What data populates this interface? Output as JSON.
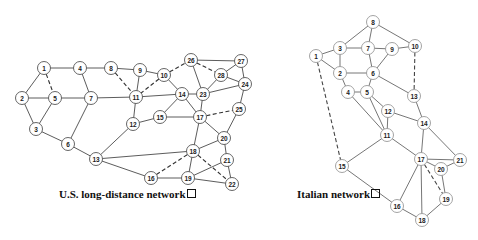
{
  "figure": {
    "networks": [
      {
        "id": "us",
        "caption": "U.S. long-distance network",
        "caption_pos": [
          59,
          188
        ],
        "nodes": [
          {
            "id": "1",
            "x": 44,
            "y": 68
          },
          {
            "id": "2",
            "x": 22,
            "y": 98
          },
          {
            "id": "3",
            "x": 36,
            "y": 129
          },
          {
            "id": "4",
            "x": 80,
            "y": 68
          },
          {
            "id": "5",
            "x": 55,
            "y": 98
          },
          {
            "id": "6",
            "x": 68,
            "y": 144
          },
          {
            "id": "7",
            "x": 91,
            "y": 98
          },
          {
            "id": "8",
            "x": 111,
            "y": 68
          },
          {
            "id": "9",
            "x": 140,
            "y": 70
          },
          {
            "id": "10",
            "x": 164,
            "y": 75
          },
          {
            "id": "11",
            "x": 136,
            "y": 97
          },
          {
            "id": "12",
            "x": 133,
            "y": 124
          },
          {
            "id": "13",
            "x": 96,
            "y": 159
          },
          {
            "id": "14",
            "x": 182,
            "y": 94
          },
          {
            "id": "15",
            "x": 160,
            "y": 117
          },
          {
            "id": "16",
            "x": 151,
            "y": 178
          },
          {
            "id": "17",
            "x": 200,
            "y": 117
          },
          {
            "id": "18",
            "x": 193,
            "y": 151
          },
          {
            "id": "19",
            "x": 188,
            "y": 178
          },
          {
            "id": "20",
            "x": 224,
            "y": 138
          },
          {
            "id": "21",
            "x": 227,
            "y": 160
          },
          {
            "id": "22",
            "x": 232,
            "y": 184
          },
          {
            "id": "23",
            "x": 203,
            "y": 94
          },
          {
            "id": "24",
            "x": 245,
            "y": 84
          },
          {
            "id": "25",
            "x": 239,
            "y": 109
          },
          {
            "id": "26",
            "x": 191,
            "y": 60
          },
          {
            "id": "27",
            "x": 241,
            "y": 61
          },
          {
            "id": "28",
            "x": 221,
            "y": 75
          }
        ],
        "edges": [
          [
            "1",
            "4",
            "solid"
          ],
          [
            "1",
            "2",
            "solid"
          ],
          [
            "1",
            "5",
            "dashed"
          ],
          [
            "2",
            "5",
            "solid"
          ],
          [
            "2",
            "3",
            "solid"
          ],
          [
            "3",
            "5",
            "solid"
          ],
          [
            "3",
            "6",
            "solid"
          ],
          [
            "4",
            "7",
            "solid"
          ],
          [
            "4",
            "8",
            "solid"
          ],
          [
            "5",
            "7",
            "solid"
          ],
          [
            "6",
            "7",
            "solid"
          ],
          [
            "6",
            "13",
            "solid"
          ],
          [
            "7",
            "11",
            "solid"
          ],
          [
            "8",
            "9",
            "solid"
          ],
          [
            "8",
            "11",
            "dashed"
          ],
          [
            "9",
            "11",
            "solid"
          ],
          [
            "9",
            "10",
            "solid"
          ],
          [
            "10",
            "11",
            "dashed"
          ],
          [
            "10",
            "26",
            "dashed"
          ],
          [
            "10",
            "14",
            "solid"
          ],
          [
            "11",
            "14",
            "solid"
          ],
          [
            "11",
            "12",
            "solid"
          ],
          [
            "12",
            "15",
            "solid"
          ],
          [
            "12",
            "13",
            "solid"
          ],
          [
            "13",
            "18",
            "solid"
          ],
          [
            "13",
            "16",
            "solid"
          ],
          [
            "14",
            "15",
            "solid"
          ],
          [
            "14",
            "17",
            "solid"
          ],
          [
            "14",
            "23",
            "solid"
          ],
          [
            "15",
            "17",
            "solid"
          ],
          [
            "16",
            "18",
            "dashed"
          ],
          [
            "16",
            "19",
            "solid"
          ],
          [
            "17",
            "18",
            "solid"
          ],
          [
            "17",
            "20",
            "solid"
          ],
          [
            "17",
            "25",
            "dashed"
          ],
          [
            "17",
            "23",
            "solid"
          ],
          [
            "18",
            "20",
            "solid"
          ],
          [
            "18",
            "19",
            "solid"
          ],
          [
            "18",
            "22",
            "dashed"
          ],
          [
            "19",
            "22",
            "solid"
          ],
          [
            "19",
            "21",
            "solid"
          ],
          [
            "20",
            "21",
            "solid"
          ],
          [
            "20",
            "25",
            "solid"
          ],
          [
            "21",
            "22",
            "solid"
          ],
          [
            "23",
            "26",
            "solid"
          ],
          [
            "23",
            "28",
            "solid"
          ],
          [
            "23",
            "24",
            "solid"
          ],
          [
            "24",
            "25",
            "solid"
          ],
          [
            "24",
            "27",
            "solid"
          ],
          [
            "24",
            "28",
            "solid"
          ],
          [
            "26",
            "27",
            "solid"
          ],
          [
            "26",
            "28",
            "dashed"
          ],
          [
            "27",
            "28",
            "solid"
          ]
        ]
      },
      {
        "id": "it",
        "caption": "Italian network",
        "caption_pos": [
          297,
          188
        ],
        "nodes": [
          {
            "id": "1",
            "x": 316,
            "y": 56
          },
          {
            "id": "2",
            "x": 340,
            "y": 73
          },
          {
            "id": "3",
            "x": 340,
            "y": 48
          },
          {
            "id": "4",
            "x": 348,
            "y": 92
          },
          {
            "id": "5",
            "x": 367,
            "y": 92
          },
          {
            "id": "6",
            "x": 373,
            "y": 73
          },
          {
            "id": "7",
            "x": 368,
            "y": 48
          },
          {
            "id": "8",
            "x": 373,
            "y": 22
          },
          {
            "id": "9",
            "x": 392,
            "y": 49
          },
          {
            "id": "10",
            "x": 415,
            "y": 46
          },
          {
            "id": "11",
            "x": 387,
            "y": 135
          },
          {
            "id": "12",
            "x": 388,
            "y": 111
          },
          {
            "id": "13",
            "x": 414,
            "y": 96
          },
          {
            "id": "14",
            "x": 424,
            "y": 123
          },
          {
            "id": "15",
            "x": 342,
            "y": 166
          },
          {
            "id": "16",
            "x": 397,
            "y": 206
          },
          {
            "id": "17",
            "x": 421,
            "y": 159
          },
          {
            "id": "18",
            "x": 422,
            "y": 220
          },
          {
            "id": "19",
            "x": 446,
            "y": 199
          },
          {
            "id": "20",
            "x": 441,
            "y": 169
          },
          {
            "id": "21",
            "x": 460,
            "y": 160
          }
        ],
        "edges": [
          [
            "8",
            "3",
            "solid"
          ],
          [
            "8",
            "7",
            "solid"
          ],
          [
            "8",
            "10",
            "solid"
          ],
          [
            "3",
            "7",
            "solid"
          ],
          [
            "3",
            "1",
            "solid"
          ],
          [
            "3",
            "2",
            "solid"
          ],
          [
            "1",
            "2",
            "solid"
          ],
          [
            "1",
            "15",
            "dashed"
          ],
          [
            "7",
            "9",
            "solid"
          ],
          [
            "7",
            "6",
            "solid"
          ],
          [
            "9",
            "10",
            "solid"
          ],
          [
            "9",
            "6",
            "solid"
          ],
          [
            "10",
            "13",
            "dashed"
          ],
          [
            "2",
            "6",
            "solid"
          ],
          [
            "2",
            "4",
            "solid"
          ],
          [
            "6",
            "5",
            "solid"
          ],
          [
            "6",
            "13",
            "solid"
          ],
          [
            "4",
            "5",
            "solid"
          ],
          [
            "4",
            "11",
            "solid"
          ],
          [
            "5",
            "11",
            "solid"
          ],
          [
            "5",
            "12",
            "solid"
          ],
          [
            "12",
            "11",
            "solid"
          ],
          [
            "12",
            "14",
            "solid"
          ],
          [
            "13",
            "14",
            "solid"
          ],
          [
            "14",
            "17",
            "solid"
          ],
          [
            "14",
            "21",
            "solid"
          ],
          [
            "11",
            "17",
            "solid"
          ],
          [
            "11",
            "15",
            "solid"
          ],
          [
            "15",
            "16",
            "solid"
          ],
          [
            "17",
            "21",
            "solid"
          ],
          [
            "17",
            "20",
            "solid"
          ],
          [
            "20",
            "21",
            "solid"
          ],
          [
            "20",
            "19",
            "solid"
          ],
          [
            "17",
            "19",
            "dashed"
          ],
          [
            "17",
            "16",
            "solid"
          ],
          [
            "17",
            "18",
            "solid"
          ],
          [
            "16",
            "18",
            "solid"
          ],
          [
            "18",
            "19",
            "solid"
          ]
        ]
      }
    ]
  }
}
